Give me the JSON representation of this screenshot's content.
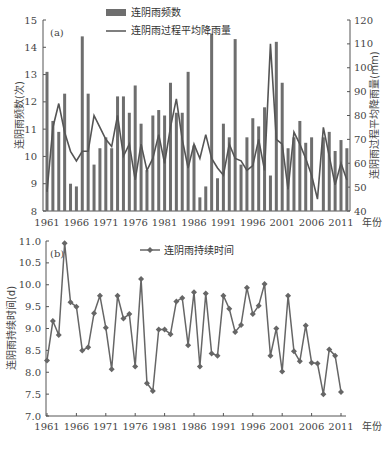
{
  "chart_data": [
    {
      "type": "bar",
      "panel_label": "(a)",
      "title": "",
      "xlabel": "年份",
      "ylabel": "连阴雨频数(次)",
      "ylabel_right": "连阴雨过程平均降雨量(mm)",
      "ylim": [
        8,
        15
      ],
      "ylim_right": [
        40,
        120
      ],
      "yticks": [
        8,
        9,
        10,
        11,
        12,
        13,
        14,
        15
      ],
      "yticks_right": [
        40,
        50,
        60,
        70,
        80,
        90,
        100,
        110,
        120
      ],
      "xtick_labels": [
        "1961",
        "1966",
        "1971",
        "1976",
        "1981",
        "1986",
        "1991",
        "1996",
        "2001",
        "2006",
        "2011"
      ],
      "grid": false,
      "legend_position": "top-right",
      "x": [
        1961,
        1962,
        1963,
        1964,
        1965,
        1966,
        1967,
        1968,
        1969,
        1970,
        1971,
        1972,
        1973,
        1974,
        1975,
        1976,
        1977,
        1978,
        1979,
        1980,
        1981,
        1982,
        1983,
        1984,
        1985,
        1986,
        1987,
        1988,
        1989,
        1990,
        1991,
        1992,
        1993,
        1994,
        1995,
        1996,
        1997,
        1998,
        1999,
        2000,
        2001,
        2002,
        2003,
        2004,
        2005,
        2006,
        2007,
        2008,
        2009,
        2010,
        2011,
        2012
      ],
      "series": [
        {
          "name": "连阴雨频数",
          "type": "bar",
          "axis": "left",
          "color": "#6e6e6e",
          "values": [
            13.1,
            11.3,
            10.9,
            12.3,
            9.0,
            8.9,
            14.4,
            12.3,
            9.7,
            10.3,
            10.7,
            10.3,
            12.2,
            12.2,
            11.6,
            12.6,
            11.2,
            9.5,
            11.5,
            11.7,
            11.5,
            12.7,
            11.6,
            11.6,
            13.1,
            10.4,
            8.5,
            8.9,
            14.5,
            9.2,
            11.2,
            10.7,
            14.3,
            9.7,
            10.7,
            11.4,
            11.1,
            11.8,
            9.3,
            14.2,
            12.7,
            10.3,
            10.7,
            11.3,
            10.5,
            10.7,
            8.0,
            10.7,
            10.9,
            10.2,
            10.6,
            10.3
          ]
        },
        {
          "name": "连阴雨过程平均降雨量",
          "type": "line",
          "axis": "right",
          "color": "#555555",
          "values": [
            48,
            75,
            85,
            73,
            65,
            61,
            65,
            65,
            80,
            75,
            70,
            67,
            80,
            63,
            68,
            53,
            68,
            57,
            62,
            72,
            60,
            75,
            87,
            70,
            58,
            68,
            62,
            72,
            62,
            58,
            55,
            68,
            62,
            61,
            57,
            59,
            70,
            57,
            110,
            70,
            68,
            49,
            73,
            68,
            62,
            55,
            45,
            75,
            63,
            51,
            60,
            53
          ]
        }
      ]
    },
    {
      "type": "line",
      "panel_label": "(b)",
      "title": "",
      "xlabel": "年份",
      "ylabel": "连阴雨持续时间(d)",
      "ylim": [
        7.0,
        11.0
      ],
      "yticks": [
        "7.0",
        "7.5",
        "8.0",
        "8.5",
        "9.0",
        "9.5",
        "10.0",
        "10.5",
        "11.0"
      ],
      "xtick_labels": [
        "1961",
        "1966",
        "1971",
        "1976",
        "1981",
        "1986",
        "1991",
        "1996",
        "2001",
        "2006",
        "2011"
      ],
      "grid": false,
      "legend_position": "top-center",
      "x": [
        1961,
        1962,
        1963,
        1964,
        1965,
        1966,
        1967,
        1968,
        1969,
        1970,
        1971,
        1972,
        1973,
        1974,
        1975,
        1976,
        1977,
        1978,
        1979,
        1980,
        1981,
        1982,
        1983,
        1984,
        1985,
        1986,
        1987,
        1988,
        1989,
        1990,
        1991,
        1992,
        1993,
        1994,
        1995,
        1996,
        1997,
        1998,
        1999,
        2000,
        2001,
        2002,
        2003,
        2004,
        2005,
        2006,
        2007,
        2008,
        2009,
        2010,
        2011
      ],
      "series": [
        {
          "name": "连阴雨持续时间",
          "marker": "diamond",
          "color": "#666666",
          "values": [
            8.27,
            9.17,
            8.85,
            10.95,
            9.6,
            9.5,
            8.5,
            8.57,
            9.35,
            9.75,
            9.02,
            8.07,
            9.75,
            9.23,
            9.33,
            8.13,
            10.13,
            7.75,
            7.57,
            8.98,
            8.98,
            8.87,
            9.62,
            9.7,
            8.62,
            9.83,
            8.13,
            9.8,
            8.43,
            8.38,
            9.75,
            9.45,
            8.92,
            9.08,
            9.93,
            9.33,
            9.52,
            10.02,
            8.38,
            9.0,
            8.02,
            9.75,
            8.48,
            8.25,
            9.07,
            8.22,
            8.2,
            7.5,
            8.52,
            8.38,
            7.55
          ]
        }
      ]
    }
  ]
}
